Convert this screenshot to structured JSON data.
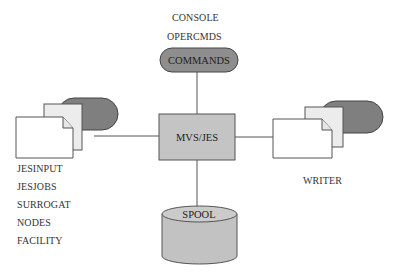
{
  "diagram": {
    "center": {
      "label": "MVS/JES",
      "fill": "#c4c4c4"
    },
    "top": {
      "labels_above": [
        "CONSOLE",
        "OPERCMDS"
      ],
      "node_label": "COMMANDS",
      "fill": "#8e8e8e"
    },
    "left": {
      "labels_below": [
        "JESINPUT",
        "JESJOBS",
        "SURROGAT",
        "NODES",
        "FACILITY"
      ],
      "pill_fill": "#7f7f7f",
      "back_doc_fill": "#ececec",
      "front_doc_fill": "#ffffff"
    },
    "right": {
      "labels_below": [
        "WRITER"
      ],
      "pill_fill": "#7f7f7f",
      "back_doc_fill": "#ececec",
      "front_doc_fill": "#ffffff"
    },
    "bottom": {
      "node_label": "SPOOL",
      "fill": "#c2c2c2"
    },
    "line_color": "#555555"
  }
}
